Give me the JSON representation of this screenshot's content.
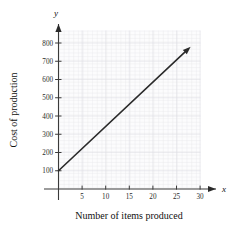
{
  "chart_data": {
    "type": "line",
    "title": "",
    "xlabel": "Number of items produced",
    "ylabel": "Cost of production",
    "x_axis_variable": "x",
    "y_axis_variable": "y",
    "xlim": [
      0,
      31
    ],
    "ylim": [
      0,
      840
    ],
    "xticks": [
      5,
      10,
      15,
      20,
      25,
      30
    ],
    "xtick_labels": [
      "5",
      "10",
      "15",
      "20",
      "25",
      "30"
    ],
    "yticks": [
      100,
      200,
      300,
      400,
      500,
      600,
      700,
      800
    ],
    "ytick_labels": [
      "100",
      "200",
      "300",
      "400",
      "500",
      "600",
      "700",
      "800"
    ],
    "grid": true,
    "grid_minor_step_x": 1,
    "grid_minor_step_y": 20,
    "legend": null,
    "series": [
      {
        "name": "Cost of production",
        "type": "line",
        "arrow_end": true,
        "intercept": 100,
        "slope": 24.3,
        "x": [
          0,
          28
        ],
        "values": [
          100,
          780
        ],
        "color": "#2a2a2a"
      }
    ],
    "annotations": []
  },
  "colors": {
    "axis": "#3a3a3a",
    "line": "#2a2a2a",
    "grid_minor": "#e9e9ec",
    "grid_major": "#dedee3",
    "background": "#ffffff",
    "plot_background": "#fcfcfd"
  }
}
